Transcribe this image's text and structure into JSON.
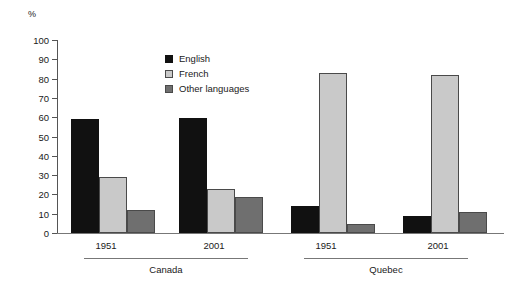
{
  "chart_data": {
    "type": "bar",
    "title": "",
    "subtitle": "",
    "xlabel": "",
    "ylabel": "%",
    "ylim": [
      0,
      100
    ],
    "ytick_step": 10,
    "yticks": [
      100,
      90,
      80,
      70,
      60,
      50,
      40,
      30,
      20,
      10,
      0
    ],
    "grid": false,
    "legend_position": "inside-top-left",
    "categories": [
      "1951",
      "2001",
      "1951",
      "2001"
    ],
    "group_labels": [
      "Canada",
      "Quebec"
    ],
    "groups": [
      {
        "region": "Canada",
        "years": [
          {
            "year": "1951",
            "values": {
              "English": 59,
              "French": 29,
              "Other languages": 12
            }
          },
          {
            "year": "2001",
            "values": {
              "English": 59.5,
              "French": 23,
              "Other languages": 18.5
            }
          }
        ]
      },
      {
        "region": "Quebec",
        "years": [
          {
            "year": "1951",
            "values": {
              "English": 14,
              "French": 83,
              "Other languages": 4.5
            }
          },
          {
            "year": "2001",
            "values": {
              "English": 9,
              "French": 82,
              "Other languages": 11
            }
          }
        ]
      }
    ],
    "series": [
      {
        "name": "English",
        "color": "#111111",
        "values": [
          59,
          59.5,
          14,
          9
        ]
      },
      {
        "name": "French",
        "color": "#c9c9c9",
        "values": [
          29,
          23,
          83,
          82
        ]
      },
      {
        "name": "Other languages",
        "color": "#6f6f6f",
        "values": [
          12,
          18.5,
          4.5,
          11
        ]
      }
    ]
  },
  "legend": {
    "items": [
      {
        "label": "English",
        "swatch": "black-square-icon"
      },
      {
        "label": "French",
        "swatch": "light-gray-square-icon"
      },
      {
        "label": "Other languages",
        "swatch": "dark-gray-square-icon"
      }
    ]
  },
  "axis": {
    "y_unit": "%"
  }
}
